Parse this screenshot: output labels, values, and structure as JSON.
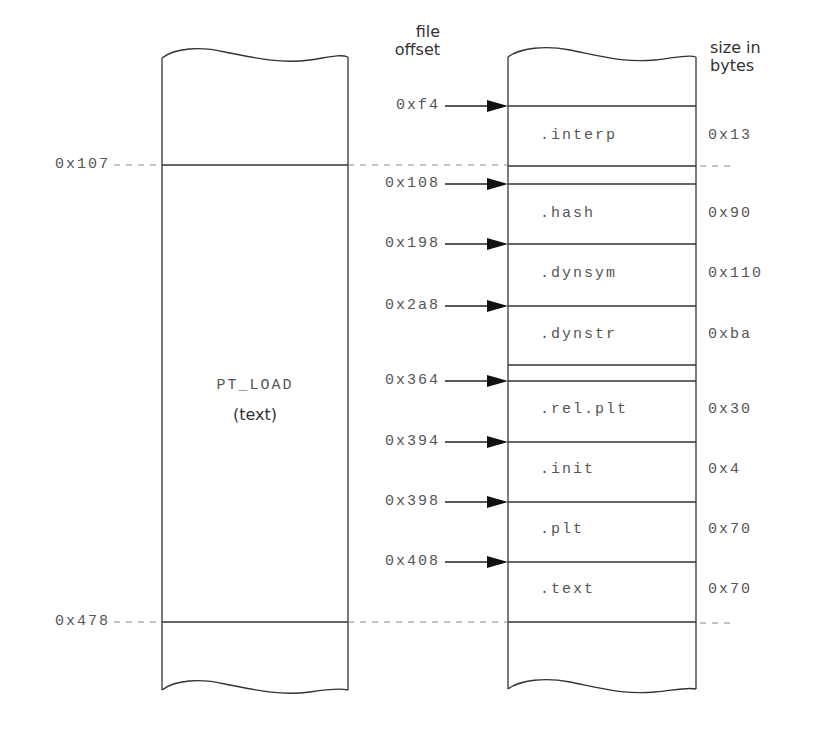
{
  "headers": {
    "file_offset": [
      "file",
      "offset"
    ],
    "size_in_bytes": [
      "size in",
      "bytes"
    ]
  },
  "segment": {
    "name": "PT_LOAD",
    "type": "(text)",
    "start_label": "0x107",
    "end_label": "0x478"
  },
  "sections": [
    {
      "name": ".interp",
      "offset": "0xf4",
      "size": "0x13"
    },
    {
      "name": ".hash",
      "offset": "0x108",
      "size": "0x90"
    },
    {
      "name": ".dynsym",
      "offset": "0x198",
      "size": "0x110"
    },
    {
      "name": ".dynstr",
      "offset": "0x2a8",
      "size": "0xba"
    },
    {
      "name": ".rel.plt",
      "offset": "0x364",
      "size": "0x30"
    },
    {
      "name": ".init",
      "offset": "0x394",
      "size": "0x4"
    },
    {
      "name": ".plt",
      "offset": "0x398",
      "size": "0x70"
    },
    {
      "name": ".text",
      "offset": "0x408",
      "size": "0x70"
    }
  ],
  "colors": {
    "line": "#333333",
    "dash": "#888888",
    "text": "#555555"
  }
}
